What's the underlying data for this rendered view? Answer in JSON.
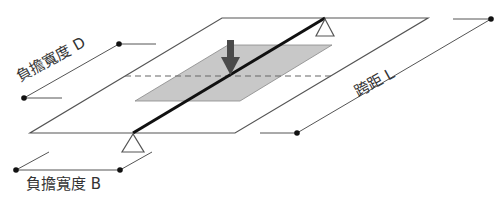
{
  "diagram": {
    "labels": {
      "load_width_d": "負擔寬度 D",
      "span_l": "跨距 L",
      "load_width_b": "負擔寬度 B"
    },
    "elements": {
      "outer_plate": "slab",
      "inner_area": "tributary-area",
      "beam": "beam",
      "load_arrow": "point-load",
      "supports": [
        "top-support",
        "bottom-support"
      ],
      "centerline": "dashed-centerline"
    },
    "colors": {
      "line": "#555555",
      "beam": "#111111",
      "fill": "#c8c8c8",
      "arrow": "#4a4a4a",
      "dot": "#111111"
    }
  }
}
